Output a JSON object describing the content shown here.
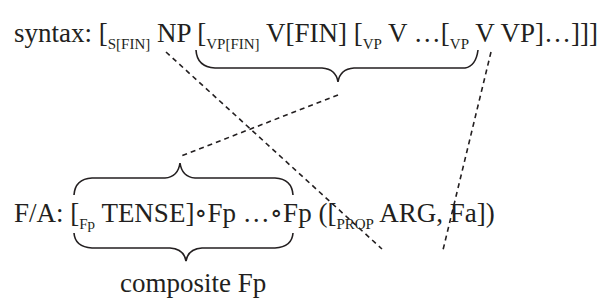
{
  "syntax_row": {
    "label": "syntax:",
    "tokens": [
      {
        "bracket": "[",
        "sub": "S[FIN]",
        "text": " NP "
      },
      {
        "bracket": "[",
        "sub": "VP[FIN]",
        "text": " V[FIN] "
      },
      {
        "bracket": "[",
        "sub": "VP",
        "text": " V …"
      },
      {
        "bracket": "[",
        "sub": "VP",
        "text": " V VP]…]]]"
      }
    ]
  },
  "fa_row": {
    "label": "F/A:",
    "tokens": [
      {
        "bracket": "[",
        "sub": "Fp",
        "text": " TENSE]∘Fp …∘Fp ("
      },
      {
        "bracket": "[",
        "sub": "PROP",
        "text": " ARG, Fa])"
      }
    ]
  },
  "caption": "composite Fp",
  "colors": {
    "ink": "#231f20",
    "background": "#ffffff"
  }
}
